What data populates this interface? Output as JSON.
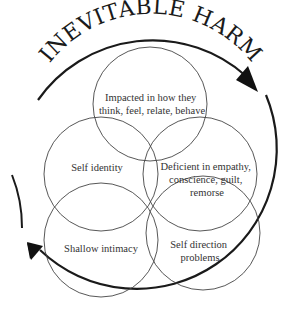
{
  "title": "INEVITABLE HARM",
  "colors": {
    "background": "#ffffff",
    "ink": "#1a1a1a",
    "circle_stroke": "#444444",
    "label_text": "#333333"
  },
  "cycle": {
    "direction": "clockwise",
    "arrowheads": [
      "upper-right",
      "lower-left"
    ]
  },
  "circles": [
    {
      "id": "top",
      "lines": [
        "Impacted in how they",
        "think, feel, relate, behave"
      ]
    },
    {
      "id": "self-identity",
      "lines": [
        "Self identity"
      ]
    },
    {
      "id": "deficient",
      "lines": [
        "Deficient in empathy,",
        "conscience, guilt,",
        "remorse"
      ]
    },
    {
      "id": "shallow-intimacy",
      "lines": [
        "Shallow intimacy"
      ]
    },
    {
      "id": "self-direction",
      "lines": [
        "Self direction",
        "problems"
      ]
    }
  ]
}
